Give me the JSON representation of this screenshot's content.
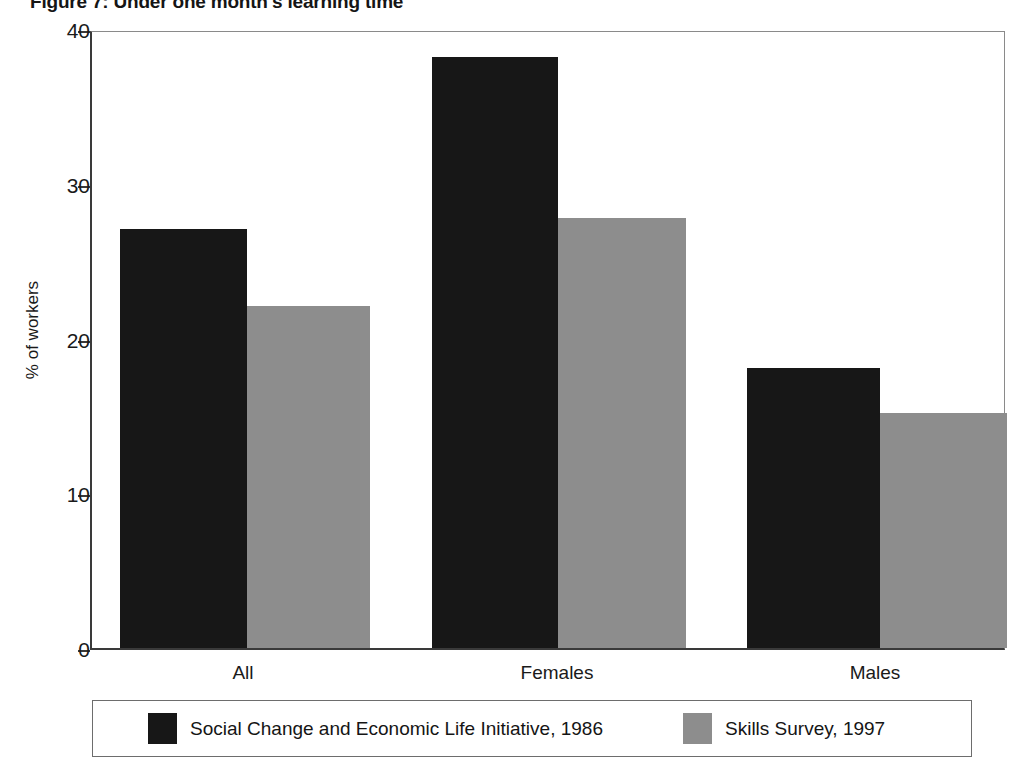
{
  "figure": {
    "title": "Figure 7: Under one month's learning time"
  },
  "chart_data": {
    "type": "bar",
    "title": "Figure 7: Under one month's learning time",
    "xlabel": "",
    "ylabel": "% of workers",
    "categories": [
      "All",
      "Females",
      "Males"
    ],
    "series": [
      {
        "name": "Social Change and Economic Life Initiative, 1986",
        "color": "#171717",
        "values": [
          27.1,
          38.2,
          18.1
        ]
      },
      {
        "name": "Skills Survey, 1997",
        "color": "#8d8d8d",
        "values": [
          22.1,
          27.8,
          15.2
        ]
      }
    ],
    "ylim": [
      0,
      40
    ],
    "yticks": [
      0,
      10,
      20,
      30,
      40
    ],
    "ytick_labels": [
      "0",
      "10",
      "20",
      "30",
      "40"
    ],
    "grid": false,
    "legend_position": "bottom"
  },
  "axes": {
    "y_title": "% of workers",
    "y_ticks": [
      {
        "value": 40,
        "label": "40"
      },
      {
        "value": 30,
        "label": "30"
      },
      {
        "value": 20,
        "label": "20"
      },
      {
        "value": 10,
        "label": "10"
      },
      {
        "value": 0,
        "label": "0"
      }
    ],
    "categories": [
      {
        "label": "All"
      },
      {
        "label": "Females"
      },
      {
        "label": "Males"
      }
    ]
  },
  "legend": {
    "entries": [
      {
        "label": "Social Change and Economic Life Initiative, 1986",
        "color": "#171717"
      },
      {
        "label": "Skills Survey, 1997",
        "color": "#8d8d8d"
      }
    ]
  }
}
